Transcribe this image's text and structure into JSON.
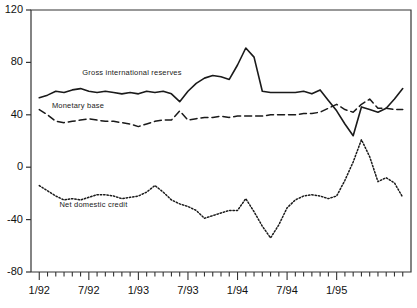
{
  "chart_data": {
    "type": "line",
    "title": "",
    "subtitle": "",
    "xlabel": "",
    "ylabel": "",
    "ylim": [
      -80,
      120
    ],
    "yticks": [
      120,
      80,
      40,
      0,
      -40,
      -80
    ],
    "ytick_labels": [
      "120",
      "80",
      "40",
      "0",
      "-40",
      "-80"
    ],
    "grid": false,
    "legend_position": "inline-annotations",
    "x_tick_interval_months": 1,
    "x_label_interval_months": 6,
    "x_start": "1/92",
    "x_end": "12/95",
    "xtick_labels": [
      "1/92",
      "7/92",
      "1/93",
      "7/93",
      "1/94",
      "7/94",
      "1/95"
    ],
    "xtick_label_indices": [
      0,
      6,
      12,
      18,
      24,
      30,
      36
    ],
    "n_points": 45,
    "series": [
      {
        "name": "Gross international reserves",
        "style": "solid",
        "color": "#1a1a1a",
        "label_x_frac": 0.135,
        "label_y_value": 72,
        "values": [
          53,
          55,
          58,
          57,
          59,
          60,
          58,
          57,
          58,
          57,
          56,
          57,
          56,
          58,
          57,
          58,
          56,
          50,
          58,
          64,
          68,
          70,
          69,
          67,
          78,
          91,
          84,
          58,
          57,
          57,
          57,
          57,
          58,
          56,
          59,
          51,
          43,
          33,
          24,
          46,
          44,
          42,
          45,
          52,
          60
        ]
      },
      {
        "name": "Monetary base",
        "style": "dashed",
        "color": "#1a1a1a",
        "label_x_frac": 0.055,
        "label_y_value": 47,
        "values": [
          44,
          40,
          35,
          34,
          35,
          36,
          37,
          36,
          35,
          35,
          34,
          33,
          31,
          33,
          35,
          36,
          36,
          43,
          36,
          37,
          38,
          38,
          39,
          38,
          39,
          39,
          39,
          39,
          40,
          40,
          40,
          40,
          41,
          41,
          42,
          45,
          48,
          44,
          42,
          48,
          52,
          45,
          45,
          44,
          44
        ]
      },
      {
        "name": "Net domestic credit",
        "style": "dotted",
        "color": "#1a1a1a",
        "label_x_frac": 0.075,
        "label_y_value": -29,
        "values": [
          -14,
          -18,
          -22,
          -25,
          -24,
          -25,
          -23,
          -21,
          -21,
          -22,
          -24,
          -23,
          -22,
          -19,
          -14,
          -19,
          -25,
          -28,
          -30,
          -33,
          -39,
          -37,
          -35,
          -33,
          -33,
          -24,
          -34,
          -45,
          -54,
          -44,
          -31,
          -25,
          -22,
          -21,
          -22,
          -24,
          -22,
          -10,
          4,
          21,
          8,
          -11,
          -8,
          -12,
          -23
        ]
      }
    ]
  }
}
